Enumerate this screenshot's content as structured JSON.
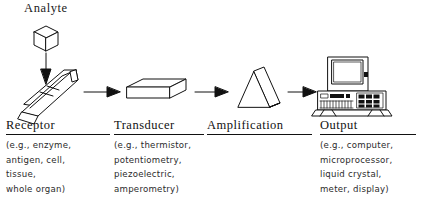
{
  "figure": {
    "analyte_label": "Analyte",
    "ink_color": "#111111",
    "background_color": "#ffffff"
  },
  "stages": [
    {
      "key": "receptor",
      "heading": "Receptor",
      "icon": "tilted-3d-bar-icon",
      "detail_lines": [
        "(e.g., enzyme,",
        "antigen, cell,",
        "tissue,",
        "whole organ)"
      ]
    },
    {
      "key": "transducer",
      "heading": "Transducer",
      "icon": "3d-slab-icon",
      "detail_lines": [
        "(e.g., thermistor,",
        "potentiometry,",
        "piezoelectric,",
        "amperometry)"
      ]
    },
    {
      "key": "amplification",
      "heading": "Amplification",
      "icon": "triangular-prism-icon",
      "detail_lines": []
    },
    {
      "key": "output",
      "heading": "Output",
      "icon": "computer-workstation-icon",
      "detail_lines": [
        "(e.g., computer,",
        "microprocessor,",
        "liquid crystal,",
        "meter, display)"
      ]
    }
  ],
  "arrows": [
    {
      "name": "arrow-analyte-to-receptor",
      "direction": "down"
    },
    {
      "name": "arrow-receptor-to-transducer",
      "direction": "right"
    },
    {
      "name": "arrow-transducer-to-amplification",
      "direction": "right"
    },
    {
      "name": "arrow-amplification-to-output",
      "direction": "right"
    }
  ]
}
